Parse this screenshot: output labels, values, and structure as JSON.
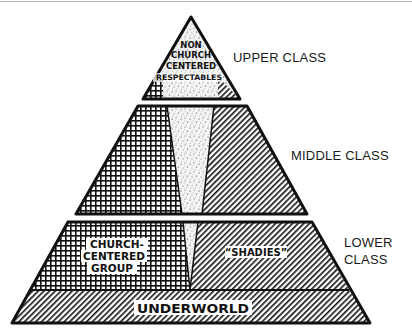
{
  "diagram": {
    "type": "social-class-pyramid",
    "tiers": [
      {
        "id": "upper",
        "label": "UPPER CLASS"
      },
      {
        "id": "middle",
        "label": "MIDDLE CLASS"
      },
      {
        "id": "lower",
        "label_line1": "LOWER",
        "label_line2": "CLASS"
      }
    ],
    "segments": {
      "respectables": {
        "lines": [
          "NON",
          "CHURCH",
          "CENTERED",
          "RESPECTABLES"
        ],
        "pattern": "stipple"
      },
      "church_centered": {
        "lines": [
          "CHURCH-",
          "CENTERED",
          "GROUP"
        ],
        "pattern": "crosshatch"
      },
      "shadies": {
        "label": "“SHADIES”",
        "pattern": "diagonal-hatch"
      },
      "underworld": {
        "label": "UNDERWORLD",
        "pattern": "diagonal-hatch"
      }
    },
    "colors": {
      "ink": "#111111",
      "paper": "#ffffff",
      "stipple_bg": "#f2f2f2"
    }
  }
}
